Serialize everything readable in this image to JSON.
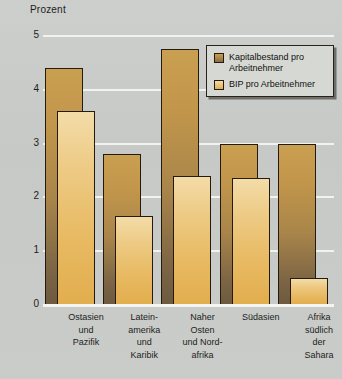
{
  "chart_data": {
    "type": "bar",
    "title": "",
    "ylabel": "Prozent",
    "xlabel": "",
    "ylim": [
      0,
      5
    ],
    "yticks": [
      0,
      1,
      2,
      3,
      4,
      5
    ],
    "grid": true,
    "legend_position": "top-right",
    "categories": [
      "Ostasien und Pazifik",
      "Lateinamerika und Karibik",
      "Naher Osten und Nordafrika",
      "Südasien",
      "Afrika südlich der Sahara"
    ],
    "category_lines": [
      [
        "Ostasien",
        "und",
        "Pazifik"
      ],
      [
        "Latein-",
        "amerika",
        "und",
        "Karibik"
      ],
      [
        "Naher",
        "Osten",
        "und Nord-",
        "afrika"
      ],
      [
        "Südasien"
      ],
      [
        "Afrika",
        "südlich",
        "der",
        "Sahara"
      ]
    ],
    "series": [
      {
        "name": "Kapitalbestand pro Arbeitnehmer",
        "color": "#b78a3f",
        "values": [
          4.4,
          2.8,
          4.75,
          3.0,
          3.0
        ]
      },
      {
        "name": "BIP pro Arbeitnehmer",
        "color": "#eec77c",
        "values": [
          3.6,
          1.65,
          2.4,
          2.37,
          0.5
        ]
      }
    ]
  },
  "axis": {
    "title": "Prozent",
    "tick_labels": [
      "5",
      "4",
      "3",
      "2",
      "1",
      "0"
    ]
  },
  "legend": {
    "entries": [
      {
        "label_line1": "Kapitalbestand pro",
        "label_line2": "Arbeitnehmer",
        "swatch_name": "legend-swatch-kapitalbestand"
      },
      {
        "label_line1": "BIP pro Arbeitnehmer",
        "label_line2": "",
        "swatch_name": "legend-swatch-bip"
      }
    ]
  },
  "colors": {
    "background": "#c9cbc8",
    "gridline": "#f2f3f1",
    "series_dark": "#b78a3f",
    "series_light": "#eec77c",
    "bar_outline": "#241a10",
    "text": "#1d1d1d"
  }
}
